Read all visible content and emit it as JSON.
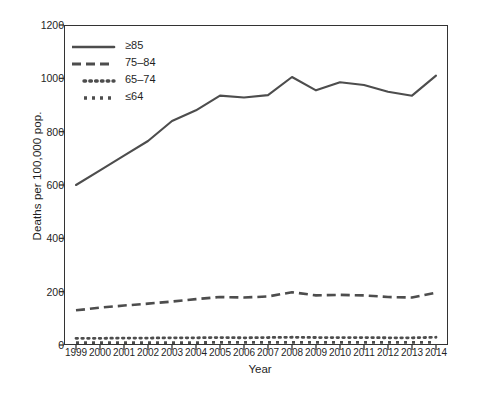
{
  "chart_data": {
    "type": "line",
    "title": "",
    "xlabel": "Year",
    "ylabel": "Deaths per 100,000 pop.",
    "grid": false,
    "legend_position": "top-left",
    "xlim": [
      1999,
      2014
    ],
    "ylim": [
      0,
      1200
    ],
    "yticks": [
      0,
      200,
      400,
      600,
      800,
      1000,
      1200
    ],
    "categories": [
      1999,
      2000,
      2001,
      2002,
      2003,
      2004,
      2005,
      2006,
      2007,
      2008,
      2009,
      2010,
      2011,
      2012,
      2013,
      2014
    ],
    "xtick_labels": [
      "1999",
      "2000",
      "2001",
      "2002",
      "2003",
      "2004",
      "2005",
      "2006",
      "2007",
      "2008",
      "2009",
      "2010",
      "2011",
      "2012",
      "2013",
      "2014"
    ],
    "series": [
      {
        "name": "≥85",
        "style": "solid",
        "color": "#4d4d4d",
        "values": [
          600,
          655,
          710,
          765,
          840,
          880,
          935,
          928,
          937,
          1005,
          955,
          985,
          975,
          950,
          935,
          1010
        ]
      },
      {
        "name": "75–84",
        "style": "dashed",
        "color": "#4d4d4d",
        "values": [
          130,
          140,
          148,
          155,
          163,
          172,
          180,
          178,
          182,
          198,
          186,
          188,
          186,
          180,
          178,
          196
        ]
      },
      {
        "name": "65–74",
        "style": "dotted",
        "color": "#4d4d4d",
        "values": [
          25,
          25,
          26,
          26,
          27,
          27,
          28,
          27,
          28,
          29,
          28,
          28,
          28,
          27,
          27,
          29
        ]
      },
      {
        "name": "≤64",
        "style": "dashdot",
        "color": "#4d4d4d",
        "values": [
          9,
          9,
          9,
          9,
          9,
          9,
          10,
          10,
          10,
          10,
          10,
          10,
          10,
          10,
          10,
          10
        ]
      }
    ]
  },
  "legend": {
    "items": [
      {
        "label": "≥85",
        "style": "solid"
      },
      {
        "label": "75–84",
        "style": "dashed"
      },
      {
        "label": "65–74",
        "style": "dotted"
      },
      {
        "label": "≤64",
        "style": "dashdot"
      }
    ]
  }
}
